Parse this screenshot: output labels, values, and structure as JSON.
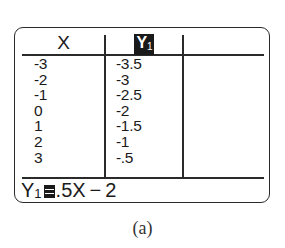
{
  "calculator_table": {
    "columns": [
      {
        "header": "X"
      },
      {
        "header_main": "Y",
        "header_sub": "1",
        "highlighted": true
      },
      {
        "header": ""
      }
    ],
    "x_values": [
      "-3",
      "-2",
      "-1",
      "0",
      "1",
      "2",
      "3"
    ],
    "y1_values": [
      "-3.5",
      "-3",
      "-2.5",
      "-2",
      "-1.5",
      "-1",
      "-.5"
    ],
    "rows": [
      {
        "x": "-3",
        "y1": "-3.5"
      },
      {
        "x": "-2",
        "y1": "-3"
      },
      {
        "x": "-1",
        "y1": "-2.5"
      },
      {
        "x": "0",
        "y1": "-2"
      },
      {
        "x": "1",
        "y1": "-1.5"
      },
      {
        "x": "2",
        "y1": "-1"
      },
      {
        "x": "3",
        "y1": "-.5"
      }
    ],
    "entry_line": {
      "var_main": "Y",
      "var_sub": "1",
      "operator_icon": "equals-highlighted-icon",
      "expression": ".5X − 2"
    }
  },
  "caption": "(a)",
  "colors": {
    "ink": "#1a1a1a",
    "border": "#2a2a2a",
    "background": "#ffffff"
  }
}
